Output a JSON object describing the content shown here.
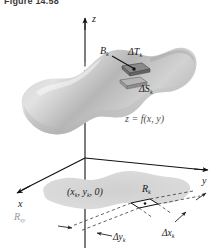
{
  "figure": {
    "caption": "Figure 14.58",
    "equation_label": "z = f(x, y)",
    "axes": {
      "x_label": "x",
      "y_label": "y",
      "z_label": "z"
    },
    "labels": {
      "tangent_patch": "ΔT",
      "tangent_patch_sub": "k",
      "surface_patch": "ΔS",
      "surface_patch_sub": "k",
      "base_point": "B",
      "base_point_sub": "k",
      "rect_point": "(x",
      "rect_point_sub1": "k",
      "rect_point_mid": ", y",
      "rect_point_sub2": "k",
      "rect_point_end": ", 0)",
      "rect_label": "R",
      "rect_label_sub": "k",
      "region_label": "R",
      "region_label_sub": "xy",
      "delta_y": "Δy",
      "delta_y_sub": "k",
      "delta_x": "Δx",
      "delta_x_sub": "k"
    },
    "colors": {
      "surface_light": "#d9d9d9",
      "surface_mid": "#bfbfbf",
      "surface_dark": "#a6a6a6",
      "shadow_region": "#d4d4d4",
      "patch_fill": "#8c8c8c",
      "axis": "#1a1a1a",
      "dashed": "#555555",
      "text": "#1a1a1a",
      "text_grey": "#9a9a9a",
      "background": "#ffffff"
    }
  }
}
